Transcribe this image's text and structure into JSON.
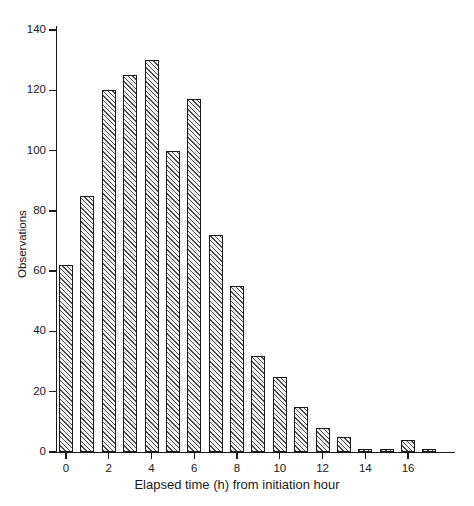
{
  "figure": {
    "caption_fragment": ""
  },
  "chart_data": {
    "type": "bar",
    "title": "",
    "subtitle": "",
    "xlabel": "Elapsed time (h) from initiation hour",
    "ylabel": "Observations",
    "x": [
      0,
      1,
      2,
      3,
      4,
      5,
      6,
      7,
      8,
      9,
      10,
      11,
      12,
      13,
      14,
      15,
      16,
      17
    ],
    "categories": [
      "0",
      "1",
      "2",
      "3",
      "4",
      "5",
      "6",
      "7",
      "8",
      "9",
      "10",
      "11",
      "12",
      "13",
      "14",
      "15",
      "16",
      "17"
    ],
    "values": [
      62,
      85,
      120,
      125,
      130,
      100,
      117,
      72,
      55,
      32,
      25,
      15,
      8,
      5,
      1,
      1,
      4,
      1
    ],
    "series": [
      {
        "name": "Observations",
        "values": [
          62,
          85,
          120,
          125,
          130,
          100,
          117,
          72,
          55,
          32,
          25,
          15,
          8,
          5,
          1,
          1,
          4,
          1
        ]
      }
    ],
    "xlim": [
      -0.9,
      17.9
    ],
    "ylim": [
      0,
      145
    ],
    "xticks": [
      0,
      2,
      4,
      6,
      8,
      10,
      12,
      14,
      16
    ],
    "xtick_labels": [
      "0",
      "2",
      "4",
      "6",
      "8",
      "10",
      "12",
      "14",
      "16"
    ],
    "yticks": [
      0,
      20,
      40,
      60,
      80,
      100,
      120,
      140
    ],
    "ytick_labels": [
      "0",
      "20",
      "40",
      "60",
      "80",
      "100",
      "120",
      "140"
    ],
    "grid": false,
    "legend": null,
    "legend_position": "none",
    "bar_fill": "hatched-diagonal",
    "bar_edge_color": "#1a1a1a",
    "bar_hatch_color": "#4a4a4a",
    "axis_color": "#1a1a1a",
    "background": "#ffffff",
    "annotations": []
  }
}
